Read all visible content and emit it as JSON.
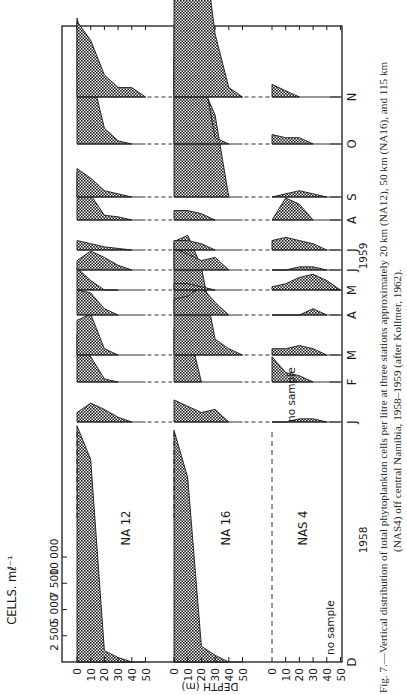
{
  "figure": {
    "orientation": "rotated 90 degrees counter-clockwise",
    "caption_line1": "Fig. 7.—Vertical distribution of total phytoplankton cells per litre at three stations approximately 20 km (NA12), 50 km (NA16), and 115 km",
    "caption_line2": "(NAS4) off central Namibia, 1958–1959 (after Kollmer, 1962).",
    "cells_axis_label": "CELLS. mℓ⁻¹",
    "cells_ticks": [
      "2 500",
      "5 000",
      "7 500",
      "10 000"
    ],
    "depth_axis_label": "DEPTH (m)",
    "depth_ticks": [
      "0",
      "10",
      "20",
      "30",
      "40",
      "50"
    ],
    "year_1958": "1958",
    "year_1959": "1959",
    "no_sample_label": "no sample",
    "colors": {
      "ink": "#1a1a1a",
      "fill": "#3a3a3a",
      "paper": "#ffffff"
    }
  },
  "chart_data": {
    "type": "area",
    "title": "Vertical distribution of total phytoplankton cells per litre",
    "xlabel": "Month (Dec 1958 – Nov 1959)",
    "ylabel": "DEPTH (m)",
    "value_label": "CELLS. ml⁻¹",
    "value_range": [
      0,
      12000
    ],
    "depth_levels_m": [
      0,
      10,
      20,
      30,
      40,
      50
    ],
    "stations": [
      "NA 12",
      "NA 16",
      "NAS 4"
    ],
    "station_distance_km": {
      "NA 12": 20,
      "NA 16": 50,
      "NAS 4": 115
    },
    "months": [
      "D",
      "J",
      "F",
      "M",
      "A",
      "M",
      "J",
      "J",
      "A",
      "S",
      "O",
      "N"
    ],
    "month_years": [
      "1958",
      "1959",
      "1959",
      "1959",
      "1959",
      "1959",
      "1959",
      "1959",
      "1959",
      "1959",
      "1959",
      "1959"
    ],
    "series": [
      {
        "name": "NA 12",
        "profiles": {
          "D": [
            10500,
            9000,
            500,
            200,
            0,
            null
          ],
          "J": [
            300,
            600,
            400,
            150,
            0,
            null
          ],
          "F": [
            1500,
            800,
            100,
            0,
            null,
            null
          ],
          "M": [
            1100,
            1300,
            200,
            0,
            null,
            null
          ],
          "A": [
            800,
            700,
            200,
            0,
            null,
            null
          ],
          "M2": [
            700,
            300,
            0,
            0,
            null,
            null
          ],
          "J2": [
            300,
            200,
            100,
            50,
            0,
            null
          ],
          "A2": [
            1500,
            800,
            150,
            100,
            0,
            null
          ],
          "S": [
            900,
            600,
            200,
            100,
            0,
            null
          ],
          "O": [
            4000,
            2300,
            500,
            100,
            0,
            null
          ],
          "N": [
            2400,
            1800,
            700,
            300,
            300,
            0
          ]
        }
      },
      {
        "name": "NA 16",
        "profiles": {
          "D": [
            10300,
            8200,
            700,
            300,
            0,
            null
          ],
          "J": [
            700,
            500,
            300,
            400,
            0,
            null
          ],
          "F": [
            1700,
            1800,
            0,
            null,
            null,
            null
          ],
          "M": [
            3600,
            3800,
            2800,
            500,
            200,
            0
          ],
          "A": [
            500,
            600,
            900,
            400,
            0,
            null
          ],
          "M2": [
            200,
            200,
            100,
            0,
            null,
            null
          ],
          "J2": [
            300,
            300,
            200,
            0,
            null,
            null
          ],
          "A2": [
            300,
            300,
            200,
            0,
            null,
            null
          ],
          "S": [
            4400,
            3100,
            3600,
            2600,
            0,
            null
          ],
          "O": [
            3600,
            3200,
            2600,
            200,
            0,
            null
          ],
          "N": [
            6800,
            6400,
            5400,
            2000,
            300,
            0
          ]
        }
      },
      {
        "name": "NAS 4",
        "profiles": {
          "D": "no sample",
          "J": [
            0,
            0,
            100,
            100,
            0,
            null
          ],
          "F": [
            800,
            300,
            200,
            0,
            null,
            null
          ],
          "M": [
            200,
            200,
            300,
            200,
            0,
            null
          ],
          "A": [
            0,
            0,
            0,
            200,
            0,
            null
          ],
          "M2": [
            100,
            200,
            400,
            500,
            300,
            0
          ],
          "J2": [
            300,
            400,
            300,
            200,
            0,
            null
          ],
          "A2": [
            0,
            700,
            500,
            0,
            null,
            null
          ],
          "S": [
            0,
            100,
            200,
            100,
            0,
            null
          ],
          "O": [
            300,
            200,
            200,
            0,
            null,
            null
          ],
          "N": [
            400,
            200,
            0,
            null,
            null,
            null
          ]
        }
      }
    ],
    "annotations": [
      "no sample (NAS 4, Dec 1958)",
      "no sample (NAS 4, Jan 1959)"
    ],
    "grid": false,
    "legend": "none"
  }
}
